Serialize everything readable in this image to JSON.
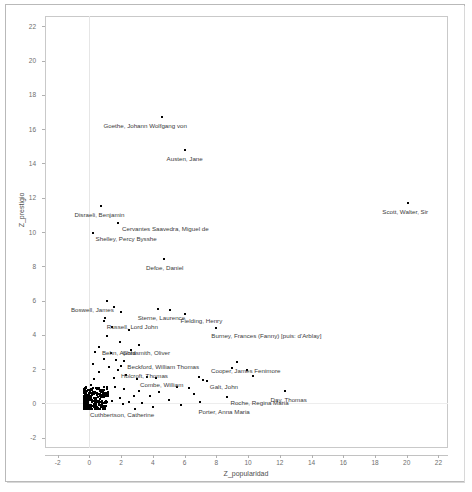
{
  "chart_data": {
    "type": "scatter",
    "title": "",
    "xlabel": "Z_popularidad",
    "ylabel": "Z_prestigio",
    "xlim": [
      -2.8,
      22.6
    ],
    "ylim": [
      -2.6,
      22.6
    ],
    "xticks": [
      -2,
      0,
      2,
      4,
      6,
      8,
      10,
      12,
      14,
      16,
      18,
      20,
      22
    ],
    "yticks": [
      -2,
      0,
      2,
      4,
      6,
      8,
      10,
      12,
      14,
      16,
      18,
      20,
      22
    ],
    "grid": "light vertical gridline at x=0 and faint horizontal gridline at y=0",
    "legend": "none",
    "marker_color": "#000000",
    "marker": "square",
    "labeled_points": [
      {
        "name": "Goethe, Johann Wolfgang von",
        "x": 4.6,
        "y": 16.7,
        "label_dx": -59,
        "label_dy": 5
      },
      {
        "name": "Austen, Jane",
        "x": 6.0,
        "y": 14.8,
        "label_dx": -18,
        "label_dy": 5
      },
      {
        "name": "Scott, Walter, Sir",
        "x": 20.1,
        "y": 11.7,
        "label_dx": -26,
        "label_dy": 5
      },
      {
        "name": "Disraeli, Benjamin",
        "x": 0.7,
        "y": 11.5,
        "label_dx": -26,
        "label_dy": 5
      },
      {
        "name": "Cervantes Saavedra, Miguel de",
        "x": 1.8,
        "y": 10.5,
        "label_dx": 4,
        "label_dy": 2
      },
      {
        "name": "Shelley, Percy Bysshe",
        "x": 0.2,
        "y": 9.95,
        "label_dx": 3,
        "label_dy": 2
      },
      {
        "name": "Defoe, Daniel",
        "x": 4.7,
        "y": 8.4,
        "label_dx": -18,
        "label_dy": 5
      },
      {
        "name": "Sterne, Laurence",
        "x": 4.3,
        "y": 5.5,
        "label_dx": -20,
        "label_dy": 5
      },
      {
        "name": "Boswell, James",
        "x": 1.1,
        "y": 6.0,
        "label_dx": -36,
        "label_dy": 5
      },
      {
        "name": "Fielding, Henry",
        "x": 6.0,
        "y": 5.2,
        "label_dx": -4,
        "label_dy": 3
      },
      {
        "name": "Russell, Lord John",
        "x": 0.9,
        "y": 4.8,
        "label_dx": 3,
        "label_dy": 2
      },
      {
        "name": "Burney, Frances (Fanny) [puis: d'Arblay]",
        "x": 8.0,
        "y": 4.4,
        "label_dx": -5,
        "label_dy": 4
      },
      {
        "name": "Behn, Aphra",
        "x": 0.6,
        "y": 3.3,
        "label_dx": 3,
        "label_dy": 2
      },
      {
        "name": "Goldsmith, Oliver",
        "x": 3.1,
        "y": 3.4,
        "label_dx": -16,
        "label_dy": 4
      },
      {
        "name": "Beckford, William Thomas",
        "x": 2.2,
        "y": 2.5,
        "label_dx": 3,
        "label_dy": 2
      },
      {
        "name": "Cooper, James Fenimore",
        "x": 9.3,
        "y": 2.4,
        "label_dx": -26,
        "label_dy": 5
      },
      {
        "name": "Holcroft, Thomas",
        "x": 1.8,
        "y": 1.95,
        "label_dx": 3,
        "label_dy": 2
      },
      {
        "name": "Combe, William",
        "x": 3.0,
        "y": 1.4,
        "label_dx": 3,
        "label_dy": 2
      },
      {
        "name": "Galt, John",
        "x": 7.4,
        "y": 1.3,
        "label_dx": 3,
        "label_dy": 2
      },
      {
        "name": "Roche, Regina Maria",
        "x": 8.7,
        "y": 0.35,
        "label_dx": 3,
        "label_dy": 2
      },
      {
        "name": "Day, Thomas",
        "x": 12.3,
        "y": 0.75,
        "label_dx": -14,
        "label_dy": 5
      },
      {
        "name": "Porter, Anna Maria",
        "x": 7.0,
        "y": 0.1,
        "label_dx": -2,
        "label_dy": 6
      },
      {
        "name": "Cuthbertson, Catherine",
        "x": 0.8,
        "y": 0.05,
        "label_dx": -12,
        "label_dy": 8
      }
    ],
    "unlabeled_points": [
      {
        "x": 1.0,
        "y": 5.0
      },
      {
        "x": 1.55,
        "y": 5.6
      },
      {
        "x": 2.0,
        "y": 5.35
      },
      {
        "x": 1.4,
        "y": 4.45
      },
      {
        "x": 2.5,
        "y": 4.3
      },
      {
        "x": 5.1,
        "y": 5.45
      },
      {
        "x": 1.1,
        "y": 3.95
      },
      {
        "x": 1.9,
        "y": 3.6
      },
      {
        "x": 2.6,
        "y": 3.1
      },
      {
        "x": 1.35,
        "y": 2.95
      },
      {
        "x": 0.95,
        "y": 2.6
      },
      {
        "x": 1.7,
        "y": 2.55
      },
      {
        "x": 2.0,
        "y": 2.2
      },
      {
        "x": 1.25,
        "y": 2.1
      },
      {
        "x": 0.6,
        "y": 1.85
      },
      {
        "x": 2.3,
        "y": 1.65
      },
      {
        "x": 1.55,
        "y": 1.5
      },
      {
        "x": 3.6,
        "y": 1.55
      },
      {
        "x": 4.2,
        "y": 1.5
      },
      {
        "x": 6.9,
        "y": 1.55
      },
      {
        "x": 7.15,
        "y": 1.35
      },
      {
        "x": 9.0,
        "y": 2.05
      },
      {
        "x": 9.9,
        "y": 1.95
      },
      {
        "x": 10.3,
        "y": 1.6
      },
      {
        "x": 5.5,
        "y": 0.95
      },
      {
        "x": 6.3,
        "y": 0.9
      },
      {
        "x": 6.6,
        "y": 0.55
      },
      {
        "x": 4.4,
        "y": 0.65
      },
      {
        "x": 3.8,
        "y": 0.45
      },
      {
        "x": 3.1,
        "y": 0.75
      },
      {
        "x": 2.8,
        "y": 0.45
      },
      {
        "x": 2.2,
        "y": 0.85
      },
      {
        "x": 1.6,
        "y": 0.95
      },
      {
        "x": 5.0,
        "y": 0.2
      },
      {
        "x": 5.8,
        "y": -0.1
      },
      {
        "x": 4.0,
        "y": -0.2
      },
      {
        "x": 3.3,
        "y": 0.05
      },
      {
        "x": 2.5,
        "y": 0.1
      },
      {
        "x": 1.9,
        "y": 0.3
      },
      {
        "x": 1.2,
        "y": 0.55
      },
      {
        "x": 0.5,
        "y": 0.9
      },
      {
        "x": 0.3,
        "y": 1.4
      },
      {
        "x": 0.1,
        "y": 1.1
      },
      {
        "x": 0.45,
        "y": 0.6
      },
      {
        "x": 0.9,
        "y": 0.35
      },
      {
        "x": 1.45,
        "y": 0.15
      },
      {
        "x": 2.1,
        "y": -0.05
      },
      {
        "x": 2.9,
        "y": -0.3
      },
      {
        "x": 0.2,
        "y": 2.3
      },
      {
        "x": 0.35,
        "y": 3.0
      },
      {
        "x": 0.15,
        "y": 0.2
      },
      {
        "x": 0.05,
        "y": 0.45
      },
      {
        "x": 0.6,
        "y": 0.05
      },
      {
        "x": 1.05,
        "y": -0.15
      }
    ],
    "dense_cluster": {
      "description": "Very dense near-solid block of points close to the origin",
      "x_range": [
        -0.35,
        1.2
      ],
      "y_range": [
        -0.35,
        0.95
      ],
      "approx_count": 260
    }
  },
  "figure": {
    "frame": "light gray rectangle border around plot",
    "background": "#ffffff"
  }
}
